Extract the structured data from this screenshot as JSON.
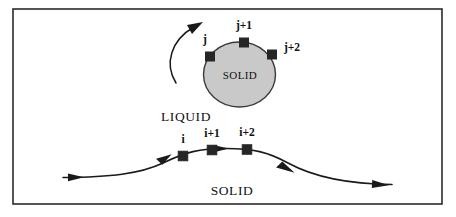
{
  "figure": {
    "background_color": "#ffffff",
    "frame": {
      "name": "figure-border",
      "x": 13,
      "y": 9,
      "width": 429,
      "height": 195,
      "stroke": "#2b2b2b",
      "stroke_width": 1.6,
      "fill": "#ffffff"
    },
    "colors": {
      "ink": "#1a1a1a",
      "marker_fill": "#262626",
      "solid_fill": "#c9c9c9",
      "solid_stroke": "#3a3a3a",
      "frame_stroke": "#2b2b2b",
      "page": "#ffffff"
    }
  },
  "particle": {
    "name": "solid-particle",
    "shape": "ellipse",
    "cx": 239.5,
    "cy": 74.5,
    "rx": 36,
    "ry": 32.5,
    "fill": "#c9c9c9",
    "stroke": "#3a3a3a",
    "stroke_width": 1.4,
    "inner_label": "SOLID",
    "inner_label_x": 240,
    "inner_label_y": 79
  },
  "rotation_arrow": {
    "name": "rotation-arrow",
    "path": "M 176 83 C 164 64, 171 40, 194 27",
    "stroke": "#1a1a1a",
    "stroke_width": 1.5,
    "head": "203,22 187,25 192,34"
  },
  "particle_nodes": [
    {
      "id": "j",
      "label": "j",
      "marker": {
        "cx": 210,
        "cy": 56.5,
        "size": 9
      },
      "label_x": 205,
      "label_y": 43
    },
    {
      "id": "j+1",
      "label": "j+1",
      "marker": {
        "cx": 244,
        "cy": 42.5,
        "size": 9
      },
      "label_x": 244,
      "label_y": 29
    },
    {
      "id": "j+2",
      "label": "j+2",
      "marker": {
        "cx": 272,
        "cy": 54.5,
        "size": 9
      },
      "label_x": 292,
      "label_y": 51
    }
  ],
  "interface_curve": {
    "name": "solid-liquid-interface-curve",
    "path": "M 63 177.5 C 110 177, 140 174, 163 163 C 186 152, 199 148.5, 226 148.5 C 253 148.5, 268 152, 288 163 C 310 175, 340 184, 392 184.5",
    "stroke": "#1a1a1a",
    "stroke_width": 1.6,
    "arrow_heads": [
      {
        "name": "interface-arrow-inlet",
        "points": "84,177.2 68,173.4 68,181.2",
        "angle": 0
      },
      {
        "name": "interface-arrow-before-i",
        "points": "173,158.4 157,155.6 160,163.8",
        "angle": -26
      },
      {
        "name": "interface-arrow-between",
        "points": "229,148.5 213,145 213,152.5",
        "angle": 0
      },
      {
        "name": "interface-arrow-after",
        "points": "296,167.6 280,163 277,171",
        "angle": 26
      },
      {
        "name": "interface-arrow-outlet",
        "points": "389,184.6 372,180.3 372,188.2",
        "angle": 3
      }
    ]
  },
  "interface_nodes": [
    {
      "id": "i",
      "label": "i",
      "marker": {
        "cx": 183,
        "cy": 156,
        "size": 9.5
      },
      "label_x": 183,
      "label_y": 143
    },
    {
      "id": "i+1",
      "label": "i+1",
      "marker": {
        "cx": 212,
        "cy": 150,
        "size": 9.5
      },
      "label_x": 212,
      "label_y": 137
    },
    {
      "id": "i+2",
      "label": "i+2",
      "marker": {
        "cx": 247,
        "cy": 149.5,
        "size": 9.5
      },
      "label_x": 247,
      "label_y": 136
    }
  ],
  "phase_labels": [
    {
      "id": "liquid",
      "name": "phase-label-liquid",
      "text": "LIQUID",
      "x": 186,
      "y": 121
    },
    {
      "id": "solid",
      "name": "phase-label-solid",
      "text": "SOLID",
      "x": 232,
      "y": 195
    }
  ]
}
